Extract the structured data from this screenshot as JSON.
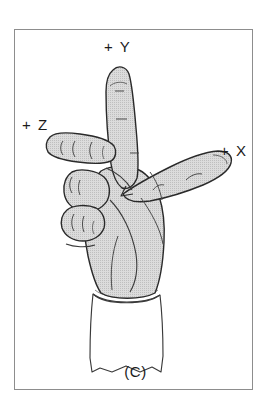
{
  "figure": {
    "caption": "(C)",
    "frame": {
      "border_color": "#8d8d8d",
      "background_color": "#ffffff"
    }
  },
  "axis_labels": [
    {
      "id": "y",
      "text": "+ Y",
      "direction": "up",
      "pointer": "index-finger"
    },
    {
      "id": "z",
      "text": "+ Z",
      "direction": "left",
      "pointer": "middle-finger"
    },
    {
      "id": "x",
      "text": "+ X",
      "direction": "right",
      "pointer": "thumb"
    }
  ],
  "illustration": {
    "name": "hand-right-hand-rule",
    "parts": [
      {
        "name": "index-finger",
        "label": "+ Y"
      },
      {
        "name": "middle-finger",
        "label": "+ Z"
      },
      {
        "name": "thumb",
        "label": "+ X"
      },
      {
        "name": "palm",
        "label": ""
      },
      {
        "name": "folded-fingers",
        "label": ""
      },
      {
        "name": "shirt-cuff",
        "label": ""
      }
    ],
    "colors": {
      "skin_fill": "#d4d4d4",
      "outline": "#2a2a2a",
      "cuff_fill": "#ffffff",
      "detail_line": "#4a4a4a"
    }
  }
}
